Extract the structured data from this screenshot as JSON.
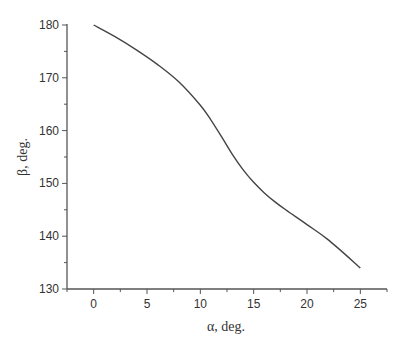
{
  "chart_data": {
    "type": "line",
    "title": "",
    "xlabel": "α, deg.",
    "ylabel": "β, deg.",
    "xlim": [
      -2.5,
      27.5
    ],
    "ylim": [
      130,
      180
    ],
    "xticks": [
      0,
      5,
      10,
      15,
      20,
      25
    ],
    "yticks": [
      130,
      140,
      150,
      160,
      170,
      180
    ],
    "grid": false,
    "legend": null,
    "series": [
      {
        "name": "β(α)",
        "color": "#444444",
        "x": [
          0,
          2,
          4,
          6,
          8,
          10,
          11,
          12,
          13,
          14,
          15,
          16,
          17,
          18,
          20,
          22,
          25
        ],
        "y": [
          180,
          177.8,
          175.3,
          172.5,
          169.2,
          164.8,
          162.0,
          158.8,
          155.5,
          152.6,
          150.2,
          148.2,
          146.5,
          145.0,
          142.2,
          139.3,
          134.0
        ]
      }
    ]
  },
  "colors": {
    "axis": "#555555",
    "line": "#444444",
    "text": "#333333"
  }
}
